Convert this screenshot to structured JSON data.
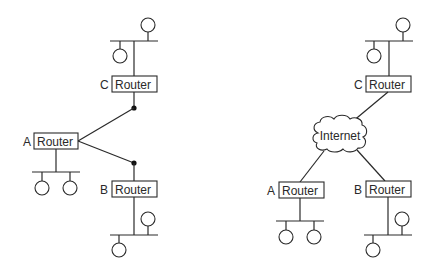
{
  "left_diagram": {
    "description": "Routers connected directly by point-to-point links",
    "routers": [
      {
        "id": "A",
        "label": "A",
        "box_text": "Router",
        "hosts": 2
      },
      {
        "id": "B",
        "label": "B",
        "box_text": "Router",
        "hosts": 2
      },
      {
        "id": "C",
        "label": "C",
        "box_text": "Router",
        "hosts": 2
      }
    ],
    "links": [
      {
        "from": "A",
        "to": "C"
      },
      {
        "from": "A",
        "to": "B"
      }
    ]
  },
  "right_diagram": {
    "description": "Routers connected through the Internet",
    "cloud_label": "Internet",
    "routers": [
      {
        "id": "A",
        "label": "A",
        "box_text": "Router",
        "hosts": 2
      },
      {
        "id": "B",
        "label": "B",
        "box_text": "Router",
        "hosts": 2
      },
      {
        "id": "C",
        "label": "C",
        "box_text": "Router",
        "hosts": 2
      }
    ],
    "links": [
      {
        "from": "C",
        "to": "Internet"
      },
      {
        "from": "A",
        "to": "Internet"
      },
      {
        "from": "B",
        "to": "Internet"
      }
    ]
  }
}
